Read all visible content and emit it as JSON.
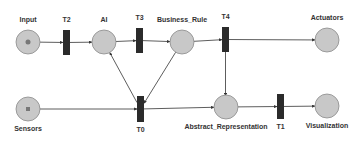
{
  "diagram": {
    "type": "petri-net",
    "colors": {
      "place_fill": "#c8c8c8",
      "place_stroke": "#8a8a8a",
      "transition_fill": "#2b2b2b",
      "arc": "#333333",
      "token": "#777777",
      "label": "#333333"
    },
    "places": [
      {
        "id": "Input",
        "label": "Input",
        "cx": 28,
        "cy": 42,
        "r": 12,
        "token": "dot"
      },
      {
        "id": "AI",
        "label": "AI",
        "cx": 104,
        "cy": 42,
        "r": 12
      },
      {
        "id": "Business_Rule",
        "label": "Business_Rule",
        "cx": 182,
        "cy": 42,
        "r": 12
      },
      {
        "id": "Actuators",
        "label": "Actuators",
        "cx": 327,
        "cy": 40,
        "r": 12
      },
      {
        "id": "Sensors",
        "label": "Sensors",
        "cx": 28,
        "cy": 109,
        "r": 12,
        "token": "square"
      },
      {
        "id": "Abstract_Representation",
        "label": "Abstract_Representation",
        "cx": 226,
        "cy": 107,
        "r": 12
      },
      {
        "id": "Visualization",
        "label": "Visualization",
        "cx": 327,
        "cy": 106,
        "r": 12
      }
    ],
    "transitions": [
      {
        "id": "T2",
        "label": "T2",
        "x": 63,
        "y": 30,
        "w": 7,
        "h": 25,
        "label_pos": "top"
      },
      {
        "id": "T3",
        "label": "T3",
        "x": 136,
        "y": 28,
        "w": 7,
        "h": 25,
        "label_pos": "top"
      },
      {
        "id": "T4",
        "label": "T4",
        "x": 222,
        "y": 27,
        "w": 7,
        "h": 25,
        "label_pos": "top"
      },
      {
        "id": "T0",
        "label": "T0",
        "x": 137,
        "y": 96,
        "w": 7,
        "h": 26,
        "label_pos": "bottom"
      },
      {
        "id": "T1",
        "label": "T1",
        "x": 277,
        "y": 94,
        "w": 7,
        "h": 25,
        "label_pos": "bottom"
      }
    ],
    "arcs": [
      {
        "from": "Input",
        "to": "T2"
      },
      {
        "from": "T2",
        "to": "AI"
      },
      {
        "from": "AI",
        "to": "T3"
      },
      {
        "from": "T3",
        "to": "Business_Rule"
      },
      {
        "from": "Business_Rule",
        "to": "T4"
      },
      {
        "from": "T4",
        "to": "Actuators"
      },
      {
        "from": "T4",
        "to": "Abstract_Representation"
      },
      {
        "from": "Sensors",
        "to": "T0"
      },
      {
        "from": "T0",
        "to": "AI"
      },
      {
        "from": "Business_Rule",
        "to": "T0"
      },
      {
        "from": "T0",
        "to": "Abstract_Representation"
      },
      {
        "from": "Abstract_Representation",
        "to": "T1"
      },
      {
        "from": "T1",
        "to": "Visualization"
      }
    ]
  }
}
